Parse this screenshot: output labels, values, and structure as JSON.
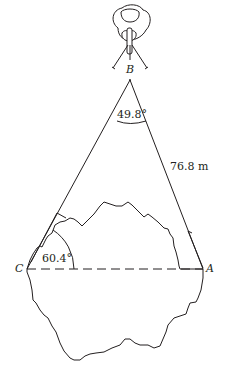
{
  "diagram": {
    "type": "triangulation-survey",
    "points": {
      "B": {
        "label": "B",
        "x": 130,
        "y": 68
      },
      "C": {
        "label": "C",
        "x": 27,
        "y": 269
      },
      "A": {
        "label": "A",
        "x": 203,
        "y": 269
      }
    },
    "angles": {
      "at_B": "49.8°",
      "at_C": "60.4°"
    },
    "lengths": {
      "BA": "76.8 m"
    },
    "colors": {
      "stroke": "#231f20",
      "background": "#ffffff"
    },
    "elements": [
      "observer-figure",
      "lake-outline",
      "triangle-lines",
      "dashed-baseline",
      "angle-arcs"
    ]
  }
}
